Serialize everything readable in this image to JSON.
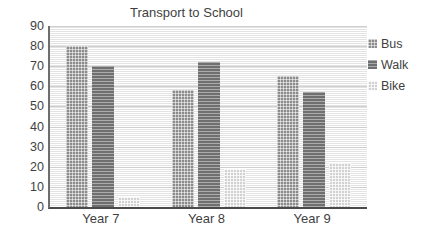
{
  "chart_data": {
    "type": "bar",
    "title": "Transport to School",
    "xlabel": "",
    "ylabel": "",
    "categories": [
      "Year 7",
      "Year 8",
      "Year 9"
    ],
    "series": [
      {
        "name": "Bus",
        "values": [
          80,
          58,
          65
        ],
        "color": "#8c8c8c",
        "pattern": "checker"
      },
      {
        "name": "Walk",
        "values": [
          70,
          72,
          57
        ],
        "color": "#6f6f6f",
        "pattern": "horizontal-lines"
      },
      {
        "name": "Bike",
        "values": [
          5,
          19,
          22
        ],
        "color": "#d2d2d2",
        "pattern": "light-checker"
      }
    ],
    "ylim": [
      0,
      90
    ],
    "ytick_step": 10,
    "yticks": [
      0,
      10,
      20,
      30,
      40,
      50,
      60,
      70,
      80,
      90
    ],
    "grid": true,
    "legend_position": "right"
  }
}
